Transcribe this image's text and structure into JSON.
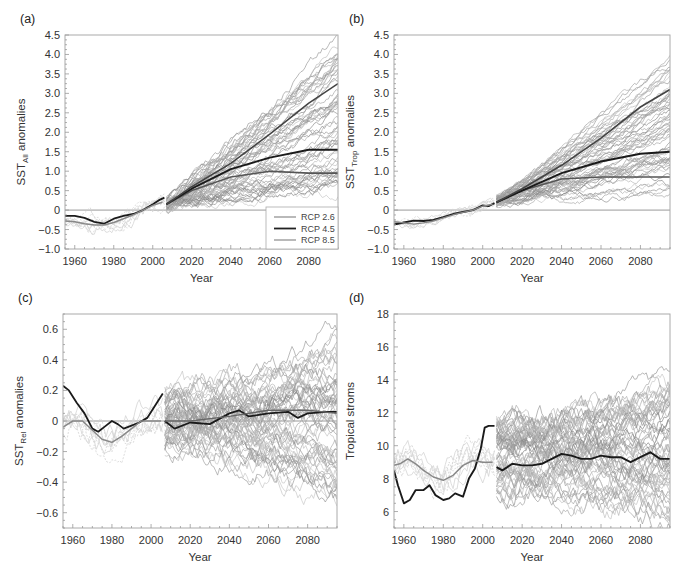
{
  "figure": {
    "caption": "Figure — (a) SST_All, (b) SST_Trop, (c) SST_Rel anomalies and (d) Tropical storms, historical and RCP projections"
  },
  "legend": {
    "entries": [
      {
        "label": "RCP 2.6",
        "color": "#8a8a8a",
        "width": 1.2
      },
      {
        "label": "RCP 4.5",
        "color": "#222222",
        "width": 1.8
      },
      {
        "label": "RCP 8.5",
        "color": "#8a8a8a",
        "width": 1.2
      }
    ]
  },
  "chart_data": [
    {
      "id": "a",
      "panel_label": "(a)",
      "type": "line",
      "title": "",
      "xlabel": "Year",
      "ylabel": "SST",
      "ylabel_sub": "All",
      "ylabel_suffix": " anomalies",
      "xlim": [
        1955,
        2095
      ],
      "ylim": [
        -1.0,
        4.5
      ],
      "xticks": [
        1960,
        1980,
        2000,
        2020,
        2040,
        2060,
        2080
      ],
      "yticks": [
        -1.0,
        -0.5,
        0,
        0.5,
        1.0,
        1.5,
        2.0,
        2.5,
        3.0,
        3.5,
        4.0,
        4.5
      ],
      "ytick_labels": [
        "−1.0",
        "−0.5",
        "0",
        "0.5",
        "1.0",
        "1.5",
        "2.0",
        "2.5",
        "3.0",
        "3.5",
        "4.0",
        "4.5"
      ],
      "zero_line": true,
      "has_legend": true,
      "legend_position": "lower right",
      "frame": {
        "x": 65,
        "y": 35,
        "w": 273,
        "h": 214
      },
      "ensemble": {
        "start": 2007,
        "end": 2095,
        "count": 60,
        "start_spread": [
          0.0,
          0.3
        ],
        "end_range": [
          0.5,
          4.4
        ],
        "noise": 0.08
      },
      "hist_ensemble": {
        "start": 1955,
        "end": 2006,
        "count": 8,
        "noise": 0.1
      },
      "series": [
        {
          "name": "Observed",
          "color": "#1a1a1a",
          "width": 1.8,
          "x": [
            1955,
            1960,
            1965,
            1970,
            1975,
            1980,
            1985,
            1990,
            1995,
            2000,
            2003,
            2006
          ],
          "y": [
            -0.15,
            -0.15,
            -0.2,
            -0.3,
            -0.35,
            -0.22,
            -0.15,
            -0.1,
            0.0,
            0.15,
            0.25,
            0.32
          ]
        },
        {
          "name": "Historical mean",
          "color": "#888888",
          "width": 1.5,
          "x": [
            1955,
            1960,
            1965,
            1970,
            1975,
            1980,
            1985,
            1990,
            1995,
            2000,
            2005
          ],
          "y": [
            -0.28,
            -0.3,
            -0.35,
            -0.38,
            -0.38,
            -0.32,
            -0.22,
            -0.12,
            0.0,
            0.12,
            0.2
          ]
        },
        {
          "name": "RCP 2.6",
          "color": "#555555",
          "width": 1.6,
          "x": [
            2007,
            2020,
            2040,
            2060,
            2080,
            2095
          ],
          "y": [
            0.15,
            0.5,
            0.85,
            1.0,
            0.95,
            0.95
          ]
        },
        {
          "name": "RCP 4.5",
          "color": "#1a1a1a",
          "width": 1.9,
          "x": [
            2007,
            2020,
            2040,
            2060,
            2080,
            2095
          ],
          "y": [
            0.15,
            0.55,
            1.05,
            1.35,
            1.55,
            1.55
          ]
        },
        {
          "name": "RCP 8.5",
          "color": "#444444",
          "width": 1.6,
          "x": [
            2007,
            2020,
            2040,
            2060,
            2080,
            2095
          ],
          "y": [
            0.15,
            0.6,
            1.2,
            1.95,
            2.75,
            3.25
          ]
        }
      ]
    },
    {
      "id": "b",
      "panel_label": "(b)",
      "type": "line",
      "title": "",
      "xlabel": "Year",
      "ylabel": "SST",
      "ylabel_sub": "Trop",
      "ylabel_suffix": " anomalies",
      "xlim": [
        1955,
        2095
      ],
      "ylim": [
        -1.0,
        4.5
      ],
      "xticks": [
        1960,
        1980,
        2000,
        2020,
        2040,
        2060,
        2080
      ],
      "yticks": [
        -1.0,
        -0.5,
        0,
        0.5,
        1.0,
        1.5,
        2.0,
        2.5,
        3.0,
        3.5,
        4.0,
        4.5
      ],
      "ytick_labels": [
        "−1.0",
        "−0.5",
        "0",
        "0.5",
        "1.0",
        "1.5",
        "2.0",
        "2.5",
        "3.0",
        "3.5",
        "4.0",
        "4.5"
      ],
      "zero_line": true,
      "has_legend": false,
      "frame": {
        "x": 394,
        "y": 35,
        "w": 276,
        "h": 214
      },
      "ensemble": {
        "start": 2007,
        "end": 2095,
        "count": 60,
        "start_spread": [
          0.1,
          0.35
        ],
        "end_range": [
          0.35,
          4.0
        ],
        "noise": 0.06
      },
      "hist_ensemble": {
        "start": 1955,
        "end": 2006,
        "count": 8,
        "noise": 0.06
      },
      "series": [
        {
          "name": "Observed",
          "color": "#1a1a1a",
          "width": 1.8,
          "x": [
            1955,
            1960,
            1965,
            1970,
            1975,
            1980,
            1985,
            1990,
            1995,
            2000,
            2003,
            2006
          ],
          "y": [
            -0.37,
            -0.32,
            -0.27,
            -0.28,
            -0.25,
            -0.18,
            -0.1,
            -0.05,
            0.0,
            0.12,
            0.1,
            0.18
          ]
        },
        {
          "name": "Historical mean",
          "color": "#888888",
          "width": 1.4,
          "x": [
            1955,
            1960,
            1965,
            1970,
            1975,
            1980,
            1985,
            1990,
            1995,
            2000,
            2005
          ],
          "y": [
            -0.3,
            -0.33,
            -0.36,
            -0.33,
            -0.28,
            -0.2,
            -0.12,
            -0.06,
            0.0,
            0.1,
            0.15
          ]
        },
        {
          "name": "RCP 2.6",
          "color": "#555555",
          "width": 1.6,
          "x": [
            2007,
            2020,
            2040,
            2060,
            2080,
            2095
          ],
          "y": [
            0.2,
            0.5,
            0.8,
            0.85,
            0.85,
            0.85
          ]
        },
        {
          "name": "RCP 4.5",
          "color": "#1a1a1a",
          "width": 1.9,
          "x": [
            2007,
            2020,
            2040,
            2060,
            2080,
            2095
          ],
          "y": [
            0.2,
            0.5,
            0.95,
            1.25,
            1.45,
            1.5
          ]
        },
        {
          "name": "RCP 8.5",
          "color": "#444444",
          "width": 1.6,
          "x": [
            2007,
            2020,
            2040,
            2060,
            2080,
            2095
          ],
          "y": [
            0.2,
            0.55,
            1.15,
            1.85,
            2.65,
            3.1
          ]
        }
      ]
    },
    {
      "id": "c",
      "panel_label": "(c)",
      "type": "line",
      "title": "",
      "xlabel": "Year",
      "ylabel": "SST",
      "ylabel_sub": "Rel",
      "ylabel_suffix": " anomalies",
      "xlim": [
        1955,
        2095
      ],
      "ylim": [
        -0.7,
        0.7
      ],
      "xticks": [
        1960,
        1980,
        2000,
        2020,
        2040,
        2060,
        2080
      ],
      "yticks": [
        -0.6,
        -0.4,
        -0.2,
        0,
        0.2,
        0.4,
        0.6
      ],
      "ytick_labels": [
        "−0.6",
        "−0.4",
        "−0.2",
        "0",
        "0.2",
        "0.4",
        "0.6"
      ],
      "zero_line": true,
      "has_legend": false,
      "frame": {
        "x": 63,
        "y": 314,
        "w": 274,
        "h": 214
      },
      "ensemble": {
        "start": 2007,
        "end": 2095,
        "count": 60,
        "start_spread": [
          -0.2,
          0.2
        ],
        "end_range": [
          -0.5,
          0.6
        ],
        "noise": 0.045
      },
      "hist_ensemble": {
        "start": 1955,
        "end": 2006,
        "count": 8,
        "noise": 0.05
      },
      "series": [
        {
          "name": "Observed",
          "color": "#1a1a1a",
          "width": 1.8,
          "x": [
            1955,
            1958,
            1962,
            1966,
            1970,
            1973,
            1976,
            1980,
            1983,
            1986,
            1990,
            1994,
            1998,
            2002,
            2006
          ],
          "y": [
            0.23,
            0.2,
            0.12,
            0.05,
            -0.05,
            -0.07,
            -0.04,
            0.0,
            -0.02,
            -0.05,
            -0.03,
            -0.01,
            0.02,
            0.1,
            0.18
          ]
        },
        {
          "name": "Historical mean",
          "color": "#888888",
          "width": 1.5,
          "x": [
            1955,
            1960,
            1965,
            1970,
            1975,
            1980,
            1985,
            1990,
            1995,
            2000,
            2005
          ],
          "y": [
            -0.04,
            0.0,
            0.0,
            -0.06,
            -0.12,
            -0.14,
            -0.1,
            -0.05,
            0.0,
            0.0,
            0.0
          ]
        },
        {
          "name": "Projection mean",
          "color": "#1a1a1a",
          "width": 1.8,
          "x": [
            2007,
            2012,
            2020,
            2030,
            2040,
            2045,
            2050,
            2060,
            2070,
            2075,
            2080,
            2090,
            2095
          ],
          "y": [
            0.0,
            -0.05,
            -0.01,
            -0.02,
            0.05,
            0.07,
            0.03,
            0.05,
            0.06,
            0.02,
            0.05,
            0.06,
            0.06
          ]
        },
        {
          "name": "Projection mean (grey)",
          "color": "#666666",
          "width": 1.4,
          "x": [
            2007,
            2020,
            2040,
            2060,
            2080,
            2095
          ],
          "y": [
            0.0,
            0.0,
            0.03,
            0.07,
            0.07,
            0.05
          ]
        }
      ]
    },
    {
      "id": "d",
      "panel_label": "(d)",
      "type": "line",
      "title": "",
      "xlabel": "Year",
      "ylabel": "Tropical stroms",
      "ylabel_sub": "",
      "ylabel_suffix": "",
      "xlim": [
        1955,
        2095
      ],
      "ylim": [
        5,
        18
      ],
      "xticks": [
        1960,
        1980,
        2000,
        2020,
        2040,
        2060,
        2080
      ],
      "yticks": [
        6,
        8,
        10,
        12,
        14,
        16,
        18
      ],
      "ytick_labels": [
        "6",
        "8",
        "10",
        "12",
        "14",
        "16",
        "18"
      ],
      "zero_line": false,
      "has_legend": false,
      "frame": {
        "x": 394,
        "y": 314,
        "w": 276,
        "h": 214
      },
      "ensemble": {
        "start": 2007,
        "end": 2095,
        "count": 60,
        "start_spread": [
          7.2,
          11.8
        ],
        "end_range": [
          5.5,
          13.5
        ],
        "noise": 0.45
      },
      "hist_ensemble": {
        "start": 1955,
        "end": 2006,
        "count": 8,
        "noise": 0.5
      },
      "series": [
        {
          "name": "Observed",
          "color": "#1a1a1a",
          "width": 1.9,
          "x": [
            1955,
            1957,
            1960,
            1963,
            1966,
            1970,
            1973,
            1976,
            1980,
            1983,
            1986,
            1990,
            1993,
            1996,
            1999,
            2001,
            2003,
            2006
          ],
          "y": [
            8.5,
            7.6,
            6.5,
            6.7,
            7.3,
            7.3,
            7.6,
            7.0,
            6.7,
            6.8,
            7.1,
            6.9,
            8.0,
            8.6,
            9.8,
            11.1,
            11.2,
            11.2
          ]
        },
        {
          "name": "Historical mean",
          "color": "#888888",
          "width": 1.5,
          "x": [
            1955,
            1958,
            1962,
            1966,
            1970,
            1975,
            1980,
            1985,
            1990,
            1995,
            2000,
            2005
          ],
          "y": [
            8.8,
            8.9,
            9.2,
            8.9,
            8.5,
            8.1,
            7.9,
            8.2,
            8.8,
            9.1,
            9.0,
            9.0
          ]
        },
        {
          "name": "Projection mean",
          "color": "#1a1a1a",
          "width": 1.9,
          "x": [
            2007,
            2010,
            2015,
            2020,
            2025,
            2030,
            2035,
            2040,
            2045,
            2050,
            2055,
            2060,
            2065,
            2070,
            2075,
            2080,
            2085,
            2090,
            2095
          ],
          "y": [
            8.7,
            8.5,
            8.9,
            8.8,
            8.8,
            8.9,
            9.2,
            9.5,
            9.4,
            9.2,
            9.2,
            9.4,
            9.3,
            9.3,
            9.0,
            9.3,
            9.6,
            9.2,
            9.2
          ]
        }
      ]
    }
  ]
}
